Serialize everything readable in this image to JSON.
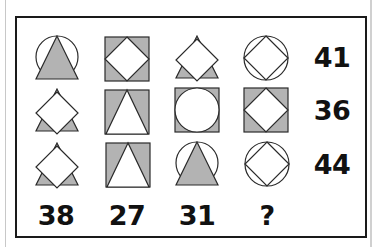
{
  "puzzle": {
    "colors": {
      "fill_gray": "#b3b3b3",
      "stroke": "#2a2a2a",
      "frame": "#1a1a1a"
    },
    "grid": [
      [
        "circle-with-gray-triangle",
        "gray-square-with-white-diamond",
        "gray-triangle-with-white-diamond",
        "circle-with-diamond"
      ],
      [
        "gray-triangle-with-white-diamond",
        "gray-square-with-white-triangle",
        "gray-square-with-white-circle",
        "gray-square-with-white-diamond"
      ],
      [
        "gray-triangle-with-white-diamond",
        "gray-square-with-white-triangle",
        "circle-with-gray-triangle",
        "circle-with-diamond"
      ]
    ],
    "row_totals": [
      "41",
      "36",
      "44"
    ],
    "column_totals": [
      "38",
      "27",
      "31",
      "?"
    ]
  }
}
